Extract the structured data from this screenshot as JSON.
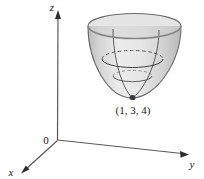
{
  "figure": {
    "type": "3d-surface-plot",
    "background_color": "#ffffff",
    "width": 204,
    "height": 179
  },
  "axes": {
    "z": {
      "label": "z",
      "label_x": 52,
      "label_y": 11
    },
    "y": {
      "label": "y",
      "label_x": 188,
      "label_y": 170
    },
    "x": {
      "label": "x",
      "label_y": 176,
      "label_x": 11
    },
    "origin": {
      "label": "0",
      "label_x": 46,
      "label_y": 140
    },
    "axis_color": "#4a4a4a"
  },
  "surface": {
    "name": "elliptic-paraboloid",
    "fill_color": "#d8d8d8",
    "edge_color": "#6e6e6e",
    "gridline_color": "#555555",
    "opening": "upward",
    "rim_center_x": 134.5,
    "rim_center_y": 26,
    "rim_rx": 46.5,
    "rim_ry": 12.5,
    "vertex_x": 132,
    "vertex_y": 98
  },
  "annotations": {
    "vertex_point": {
      "label": "(1, 3, 4)",
      "label_x": 133,
      "label_y": 113,
      "dot_color": "#3a3a3a"
    }
  }
}
